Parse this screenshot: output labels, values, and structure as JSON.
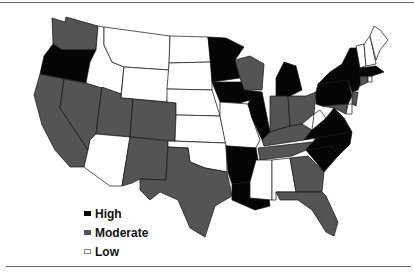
{
  "colors": {
    "high": "#050505",
    "moderate": "#545454",
    "low": "#ffffff",
    "border": "#111111"
  },
  "legend": [
    {
      "key": "high",
      "label": "High"
    },
    {
      "key": "moderate",
      "label": "Moderate"
    },
    {
      "key": "low",
      "label": "Low"
    }
  ],
  "states": {
    "high": [
      "Oregon",
      "Minnesota",
      "Iowa",
      "Illinois",
      "Michigan",
      "Arkansas",
      "Louisiana",
      "New York",
      "Pennsylvania",
      "Massachusetts",
      "Virginia",
      "North Carolina",
      "South Carolina",
      "Maryland"
    ],
    "moderate": [
      "Washington",
      "California",
      "Nevada",
      "Utah",
      "Colorado",
      "New Mexico",
      "Texas",
      "Wisconsin",
      "Indiana",
      "Ohio",
      "Kentucky",
      "Tennessee",
      "Georgia",
      "Florida",
      "New Jersey",
      "Connecticut",
      "Delaware"
    ],
    "low": [
      "Idaho",
      "Montana",
      "Wyoming",
      "North Dakota",
      "South Dakota",
      "Nebraska",
      "Kansas",
      "Oklahoma",
      "Missouri",
      "Arizona",
      "Mississippi",
      "Alabama",
      "West Virginia",
      "Maine",
      "Vermont",
      "New Hampshire",
      "Rhode Island"
    ]
  }
}
